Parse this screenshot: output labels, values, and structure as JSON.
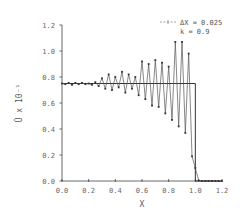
{
  "chart_data": {
    "type": "line",
    "title": "",
    "xlabel": "X",
    "ylabel": "Ū x 10⁻¹",
    "xlim": [
      0.0,
      1.2
    ],
    "ylim": [
      0.0,
      1.2
    ],
    "xticks": [
      "0.0",
      "0.2",
      "0.4",
      "0.6",
      "0.8",
      "1.0",
      "1.2"
    ],
    "yticks": [
      "0.0",
      "0.2",
      "0.4",
      "0.6",
      "0.8",
      "1.0",
      "1.2"
    ],
    "grid": false,
    "legend": {
      "position": "upper right",
      "entries": [
        "ΔX = 0.025",
        "k = 0.9"
      ]
    },
    "series": [
      {
        "name": "ΔX = 0.025 (numerical)",
        "style": "line-with-markers",
        "x": [
          0.0,
          0.025,
          0.05,
          0.075,
          0.1,
          0.125,
          0.15,
          0.175,
          0.2,
          0.225,
          0.25,
          0.275,
          0.3,
          0.325,
          0.35,
          0.375,
          0.4,
          0.425,
          0.45,
          0.475,
          0.5,
          0.525,
          0.55,
          0.575,
          0.6,
          0.625,
          0.65,
          0.675,
          0.7,
          0.725,
          0.75,
          0.775,
          0.8,
          0.825,
          0.85,
          0.875,
          0.9,
          0.925,
          0.95,
          0.975,
          1.0,
          1.025,
          1.05,
          1.075,
          1.1,
          1.125,
          1.15,
          1.175,
          1.2
        ],
        "y": [
          0.75,
          0.745,
          0.755,
          0.74,
          0.755,
          0.745,
          0.755,
          0.745,
          0.75,
          0.74,
          0.76,
          0.73,
          0.79,
          0.71,
          0.82,
          0.7,
          0.8,
          0.72,
          0.84,
          0.68,
          0.82,
          0.71,
          0.8,
          0.66,
          0.92,
          0.63,
          0.9,
          0.58,
          0.93,
          0.57,
          0.91,
          0.52,
          0.88,
          0.47,
          1.07,
          0.42,
          1.07,
          0.37,
          0.98,
          0.19,
          0.1,
          0.005,
          0.0,
          0.0,
          0.0,
          0.0,
          0.0,
          0.0,
          0.0
        ]
      },
      {
        "name": "k = 0.9 (exact)",
        "style": "solid-step",
        "x": [
          0.0,
          1.0,
          1.0,
          1.2
        ],
        "y": [
          0.75,
          0.75,
          0.0,
          0.0
        ]
      }
    ]
  }
}
